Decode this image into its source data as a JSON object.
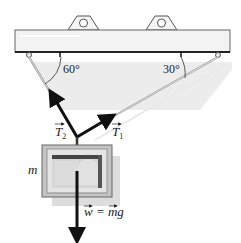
{
  "diagram": {
    "type": "free-body / tension diagram",
    "beam": {
      "label": "ceiling beam with two lifting eyes"
    },
    "angles": {
      "left": "60°",
      "right": "30°"
    },
    "forces": {
      "t2": {
        "symbol": "T",
        "subscript": "2",
        "direction": "up-left"
      },
      "t1": {
        "symbol": "T",
        "subscript": "1",
        "direction": "up-right"
      },
      "weight": {
        "text": "w = mg",
        "direction": "down"
      }
    },
    "mass": {
      "label": "m"
    },
    "colors": {
      "beam_fill": "#f2f2f2",
      "beam_edge": "#444444",
      "shadow": "#c8c8c8",
      "arrow": "#111111",
      "rope": "#888888",
      "box_outer": "#b8b8b8",
      "box_inner": "#d9d9d9"
    }
  }
}
